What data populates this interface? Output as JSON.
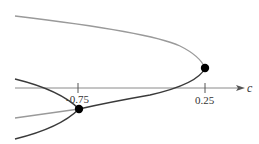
{
  "diagram": {
    "type": "bifurcation-diagram",
    "axis": {
      "label": "c",
      "ticks": [
        {
          "label": "-0.75",
          "value": -0.75
        },
        {
          "label": "0.25",
          "value": 0.25
        }
      ]
    },
    "points": [
      {
        "name": "saddle-node",
        "c": 0.25
      },
      {
        "name": "period-doubling",
        "c": -0.75
      }
    ],
    "colors": {
      "stable_curve": "#3a3a3a",
      "unstable_curve": "#9a9a9a",
      "axis": "#8a8a8a",
      "point": "#000000"
    }
  }
}
